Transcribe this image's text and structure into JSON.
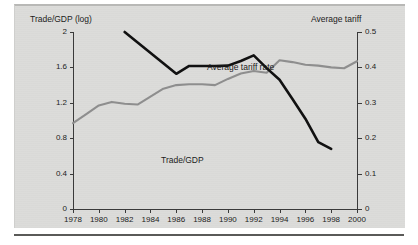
{
  "chart_data": {
    "type": "line",
    "title": "",
    "xlabel": "",
    "ylabel": "Trade/GDP (log)",
    "y2label": "Average tariff",
    "x": [
      1978,
      1979,
      1980,
      1981,
      1982,
      1983,
      1984,
      1985,
      1986,
      1987,
      1988,
      1989,
      1990,
      1991,
      1992,
      1993,
      1994,
      1995,
      1996,
      1997,
      1998,
      1999,
      2000
    ],
    "xticks": [
      "1978",
      "1980",
      "1982",
      "1984",
      "1986",
      "1988",
      "1990",
      "1992",
      "1994",
      "1996",
      "1998",
      "2000"
    ],
    "xlim": [
      1978,
      2000
    ],
    "ylim": [
      0,
      2
    ],
    "yticks": [
      "0",
      "0.4",
      "0.8",
      "1.2",
      "1.6",
      "2"
    ],
    "y2lim": [
      0,
      0.5
    ],
    "y2ticks": [
      "0",
      "0.1",
      "0.2",
      "0.3",
      "0.4",
      "0.5"
    ],
    "grid": false,
    "legend_position": "inline-annotations",
    "series": [
      {
        "name": "Trade/GDP",
        "axis": "left",
        "color": "#8e8e8e",
        "label_text": "Trade/GDP",
        "values": [
          0.97,
          1.07,
          1.17,
          1.21,
          1.19,
          1.18,
          1.27,
          1.36,
          1.4,
          1.41,
          1.41,
          1.4,
          1.47,
          1.53,
          1.56,
          1.54,
          1.68,
          1.66,
          1.63,
          1.62,
          1.6,
          1.59,
          1.67
        ]
      },
      {
        "name": "Average tariff rate",
        "axis": "right",
        "color": "#111111",
        "label_text": "Average tariff rate",
        "values": [
          null,
          null,
          null,
          null,
          0.5,
          null,
          null,
          null,
          0.382,
          0.404,
          0.404,
          0.404,
          0.405,
          0.418,
          0.434,
          0.398,
          0.365,
          0.311,
          0.255,
          0.189,
          0.17,
          null,
          null
        ]
      }
    ],
    "annotations": [
      {
        "text": "Average tariff rate",
        "x": 1984.2,
        "series": "Average tariff rate"
      },
      {
        "text": "Trade/GDP",
        "x": 1979.2,
        "series": "Trade/GDP"
      }
    ]
  }
}
